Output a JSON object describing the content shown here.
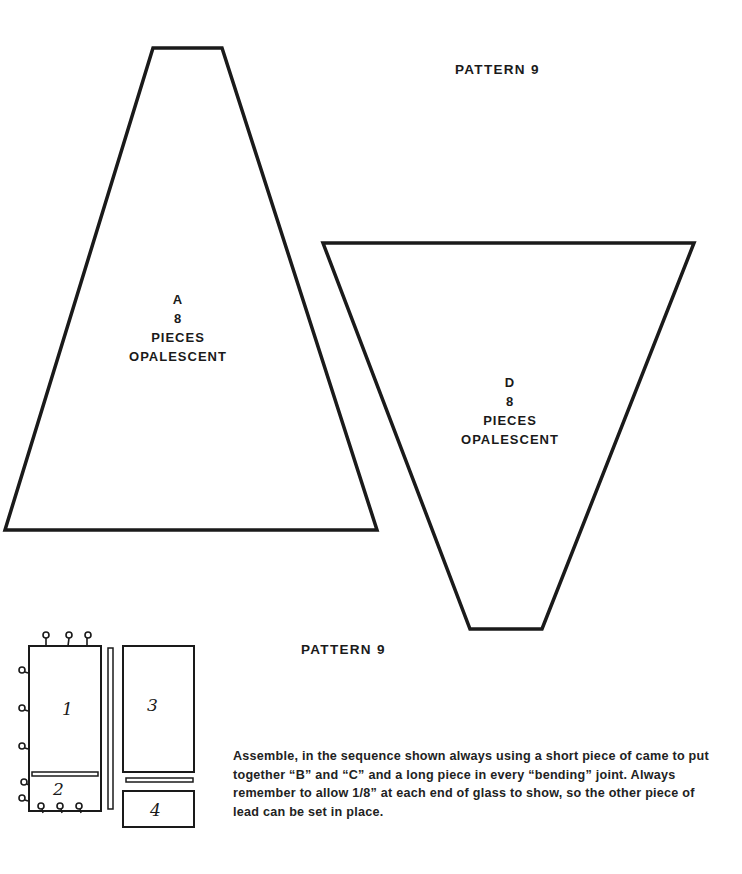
{
  "page": {
    "title_top": "PATTERN 9",
    "title_bottom": "PATTERN 9"
  },
  "pieces": [
    {
      "id": "A",
      "count": "8",
      "unit": "PIECES",
      "material": "OPALESCENT",
      "shape": "trapezoid-narrow-top"
    },
    {
      "id": "D",
      "count": "8",
      "unit": "PIECES",
      "material": "OPALESCENT",
      "shape": "trapezoid-narrow-bottom"
    }
  ],
  "assembly_diagram": {
    "step_labels": [
      "1",
      "2",
      "3",
      "4"
    ],
    "tack_mark": "a"
  },
  "instructions": "Assemble, in the sequence shown always using a short piece of came to put together “B” and “C” and a long piece in every “bending” joint. Always remember to allow 1/8” at each end of glass to show, so the other piece of lead can be set in place.",
  "colors": {
    "ink": "#1a1a1a",
    "paper": "#ffffff"
  }
}
